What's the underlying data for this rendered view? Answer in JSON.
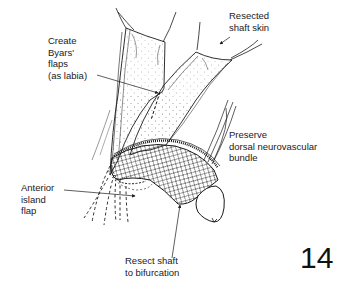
{
  "figure": {
    "number": "14",
    "type": "surgical illustration",
    "labels": {
      "resected_shaft_skin": [
        "Resected",
        "shaft skin"
      ],
      "byars_flaps": [
        "Create",
        "Byars'",
        "flaps",
        "(as labia)"
      ],
      "dorsal_bundle": [
        "Preserve",
        "dorsal neurovascular",
        "bundle"
      ],
      "anterior_island_flap": [
        "Anterior",
        "island",
        "flap"
      ],
      "resect_shaft": [
        "Resect shaft",
        "to bifurcation"
      ]
    }
  },
  "colors": {
    "ink": "#1a1a1a",
    "background": "#ffffff",
    "stipple": "#777777"
  }
}
